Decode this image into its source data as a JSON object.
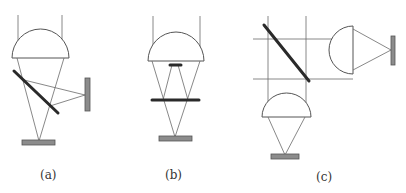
{
  "figure": {
    "panels": [
      {
        "id": "a",
        "label": "(a)",
        "description": "Focusing lens with tilted beamsplitter; two detectors (bottom and side)"
      },
      {
        "id": "b",
        "label": "(b)",
        "description": "Focusing lens with horizontal partial reflector and central obscuration; single bottom detector"
      },
      {
        "id": "c",
        "label": "(c)",
        "description": "Tilted beamsplitter before two separate focusing lenses; detector on each arm"
      }
    ],
    "colors": {
      "ray": "#6a6a6a",
      "lens_outline": "#555555",
      "mirror": "#2a2a2a",
      "detector": "#8c8c8c"
    }
  }
}
